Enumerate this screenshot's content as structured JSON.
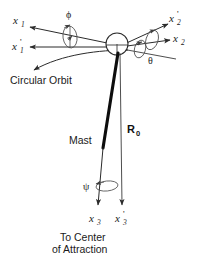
{
  "figure": {
    "background_color": "#ffffff",
    "line_color": "#2b2b2b",
    "mast_color": "#0d0d0d"
  },
  "axes": {
    "x1": {
      "label": "x",
      "subscript": "1",
      "prime": ""
    },
    "x1p": {
      "label": "x",
      "subscript": "1",
      "prime": "'"
    },
    "x2": {
      "label": "x",
      "subscript": "2",
      "prime": ""
    },
    "x2p": {
      "label": "x",
      "subscript": "2",
      "prime": "'"
    },
    "x3": {
      "label": "x",
      "subscript": "3",
      "prime": ""
    },
    "x3p": {
      "label": "x",
      "subscript": "3",
      "prime": "'"
    }
  },
  "angles": {
    "phi": "ϕ",
    "theta": "θ",
    "psi": "ψ"
  },
  "labels": {
    "circular_orbit": "Circular Orbit",
    "mast": "Mast",
    "radius_vector": "R",
    "radius_subscript": "0",
    "to_center_line1": "To Center",
    "to_center_line2": "of Attraction"
  }
}
